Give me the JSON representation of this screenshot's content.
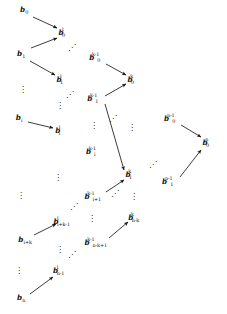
{
  "figure": {
    "type": "diagram",
    "subtype": "recursive-pairwise-reduction-tree",
    "glyphs": {
      "vertical_ellipsis": "⋮",
      "diagonal_ellipsis_up": "⋰"
    },
    "columns": [
      {
        "id": "level-0",
        "level_label": "0",
        "nodes": [
          {
            "id": "b0",
            "base": "b",
            "sub": "0",
            "sup": ""
          },
          {
            "id": "b1",
            "base": "b",
            "sub": "1",
            "sup": ""
          },
          {
            "id": "bi",
            "base": "b",
            "sub": "i",
            "sup": ""
          },
          {
            "id": "bik",
            "base": "b",
            "sub": "i+k",
            "sup": ""
          },
          {
            "id": "bn",
            "base": "b",
            "sub": "n",
            "sup": ""
          }
        ]
      },
      {
        "id": "level-1",
        "level_label": "1",
        "nodes": [
          {
            "id": "b0_1",
            "base": "b",
            "sub": "0",
            "sup": "1"
          },
          {
            "id": "b1_1",
            "base": "b",
            "sub": "1",
            "sup": "1"
          },
          {
            "id": "bi_1",
            "base": "b",
            "sub": "i",
            "sup": "1"
          },
          {
            "id": "bikm1_1",
            "base": "b",
            "sub": "i+k-1",
            "sup": "1"
          },
          {
            "id": "bnm1_1",
            "base": "b",
            "sub": "n-1",
            "sup": "1"
          }
        ]
      },
      {
        "id": "level-k-minus-1",
        "level_label": "k-1",
        "nodes": [
          {
            "id": "b0_km1",
            "base": "b",
            "sub": "0",
            "sup": "k-1"
          },
          {
            "id": "b1_km1",
            "base": "b",
            "sub": "1",
            "sup": "k-1"
          },
          {
            "id": "bi_km1",
            "base": "b",
            "sub": "i",
            "sup": "k-1"
          },
          {
            "id": "bip1_km1",
            "base": "b",
            "sub": "i+1",
            "sup": "k-1"
          },
          {
            "id": "bnmkp1_km1",
            "base": "b",
            "sub": "n-k+1",
            "sup": "k-1"
          }
        ]
      },
      {
        "id": "level-k",
        "level_label": "k",
        "nodes": [
          {
            "id": "b0_k",
            "base": "b",
            "sub": "0",
            "sup": "k"
          },
          {
            "id": "b1_k",
            "base": "b",
            "sub": "1",
            "sup": "k"
          },
          {
            "id": "bnmk_k",
            "base": "b",
            "sub": "n-k",
            "sup": "k"
          }
        ]
      },
      {
        "id": "level-n-minus-1",
        "level_label": "n-1",
        "nodes": [
          {
            "id": "b0_nm1",
            "base": "b",
            "sub": "0",
            "sup": "n-1"
          },
          {
            "id": "b1_nm1",
            "base": "b",
            "sub": "1",
            "sup": "n-1"
          }
        ]
      },
      {
        "id": "level-n",
        "level_label": "n",
        "nodes": [
          {
            "id": "b0_n",
            "base": "b",
            "sub": "0",
            "sup": "n"
          }
        ]
      }
    ],
    "edges": [
      {
        "from": "b0",
        "to": "b0_1"
      },
      {
        "from": "b1",
        "to": "b0_1"
      },
      {
        "from": "b1",
        "to": "b1_1"
      },
      {
        "from": "bi",
        "to": "bi_1"
      },
      {
        "from": "bik",
        "to": "bikm1_1"
      },
      {
        "from": "bn",
        "to": "bnm1_1"
      },
      {
        "from": "b0_km1",
        "to": "b0_k"
      },
      {
        "from": "b1_km1",
        "to": "b0_k"
      },
      {
        "from": "b1_km1",
        "to": "b1_k"
      },
      {
        "from": "bip1_km1",
        "to": "b1_k"
      },
      {
        "from": "bnmkp1_km1",
        "to": "bnmk_k"
      },
      {
        "from": "b0_nm1",
        "to": "b0_n"
      },
      {
        "from": "b1_nm1",
        "to": "b0_n"
      }
    ],
    "ellipses": [
      {
        "id": "e1",
        "kind": "diagonal_ellipsis_up",
        "glyph": "⋰"
      },
      {
        "id": "e2",
        "kind": "diagonal_ellipsis_up",
        "glyph": "⋰"
      },
      {
        "id": "e3",
        "kind": "diagonal_ellipsis_up",
        "glyph": "⋰"
      },
      {
        "id": "e4",
        "kind": "diagonal_ellipsis_up",
        "glyph": "⋰"
      },
      {
        "id": "e5",
        "kind": "diagonal_ellipsis_up",
        "glyph": "⋰"
      },
      {
        "id": "e6",
        "kind": "diagonal_ellipsis_up",
        "glyph": "⋰"
      },
      {
        "id": "e7",
        "kind": "diagonal_ellipsis_up",
        "glyph": "⋰"
      },
      {
        "id": "v1",
        "kind": "vertical_ellipsis",
        "glyph": "⋮"
      },
      {
        "id": "v2",
        "kind": "vertical_ellipsis",
        "glyph": "⋮"
      },
      {
        "id": "v3",
        "kind": "vertical_ellipsis",
        "glyph": "⋮"
      },
      {
        "id": "v4",
        "kind": "vertical_ellipsis",
        "glyph": "⋮"
      },
      {
        "id": "v5",
        "kind": "vertical_ellipsis",
        "glyph": "⋮"
      },
      {
        "id": "v6",
        "kind": "vertical_ellipsis",
        "glyph": "⋮"
      },
      {
        "id": "v7",
        "kind": "vertical_ellipsis",
        "glyph": "⋮"
      },
      {
        "id": "v8",
        "kind": "vertical_ellipsis",
        "glyph": "⋮"
      },
      {
        "id": "v9",
        "kind": "vertical_ellipsis",
        "glyph": "⋮"
      },
      {
        "id": "v10",
        "kind": "vertical_ellipsis",
        "glyph": "⋮"
      }
    ],
    "style": {
      "background": "#ffffff",
      "ink": "#141414",
      "arrow_color": "#1a1a1a"
    }
  },
  "layout": {
    "nodes": {
      "b0": {
        "x": 24,
        "y": 10
      },
      "b1": {
        "x": 21,
        "y": 54
      },
      "bi": {
        "x": 19,
        "y": 118
      },
      "bik": {
        "x": 25,
        "y": 240
      },
      "bn": {
        "x": 21,
        "y": 298
      },
      "b0_1": {
        "x": 64,
        "y": 33
      },
      "b1_1": {
        "x": 62,
        "y": 80
      },
      "bi_1": {
        "x": 60,
        "y": 131
      },
      "bikm1_1": {
        "x": 64,
        "y": 222
      },
      "bnm1_1": {
        "x": 61,
        "y": 271
      },
      "b0_km1": {
        "x": 97,
        "y": 58
      },
      "b1_km1": {
        "x": 95,
        "y": 99
      },
      "bi_km1": {
        "x": 93,
        "y": 152
      },
      "bip1_km1": {
        "x": 95,
        "y": 197
      },
      "bnmkp1_km1": {
        "x": 98,
        "y": 243
      },
      "b0_k": {
        "x": 133,
        "y": 80
      },
      "b1_k": {
        "x": 131,
        "y": 175
      },
      "bnmk_k": {
        "x": 136,
        "y": 218
      },
      "b0_nm1": {
        "x": 172,
        "y": 119
      },
      "b1_nm1": {
        "x": 170,
        "y": 182
      },
      "b0_n": {
        "x": 208,
        "y": 143
      }
    },
    "ellipses": {
      "e1": {
        "x": 72,
        "y": 48
      },
      "e2": {
        "x": 70,
        "y": 95
      },
      "e3": {
        "x": 74,
        "y": 207
      },
      "e4": {
        "x": 72,
        "y": 255
      },
      "e5": {
        "x": 113,
        "y": 119
      },
      "e6": {
        "x": 115,
        "y": 194
      },
      "e7": {
        "x": 153,
        "y": 165
      },
      "v1": {
        "x": 23,
        "y": 90
      },
      "v2": {
        "x": 21,
        "y": 196
      },
      "v3": {
        "x": 19,
        "y": 271
      },
      "v4": {
        "x": 60,
        "y": 106
      },
      "v5": {
        "x": 58,
        "y": 178
      },
      "v6": {
        "x": 60,
        "y": 250
      },
      "v7": {
        "x": 94,
        "y": 126
      },
      "v8": {
        "x": 92,
        "y": 219
      },
      "v9": {
        "x": 132,
        "y": 128
      },
      "v10": {
        "x": 134,
        "y": 197
      }
    },
    "edge_paths": {
      "b0:b0_1": {
        "x1": 33,
        "y1": 17,
        "x2": 57,
        "y2": 28
      },
      "b1:b0_1": {
        "x1": 31,
        "y1": 48,
        "x2": 57,
        "y2": 38
      },
      "b1:b1_1": {
        "x1": 30,
        "y1": 61,
        "x2": 55,
        "y2": 75
      },
      "bi:bi_1": {
        "x1": 28,
        "y1": 122,
        "x2": 53,
        "y2": 128
      },
      "bik:bikm1_1": {
        "x1": 34,
        "y1": 235,
        "x2": 56,
        "y2": 224
      },
      "bn:bnm1_1": {
        "x1": 30,
        "y1": 294,
        "x2": 53,
        "y2": 277
      },
      "b0_km1:b0_k": {
        "x1": 106,
        "y1": 64,
        "x2": 126,
        "y2": 75
      },
      "b1_km1:b0_k": {
        "x1": 105,
        "y1": 96,
        "x2": 126,
        "y2": 84
      },
      "b1_km1:b1_k": {
        "x1": 105,
        "y1": 104,
        "x2": 124,
        "y2": 170
      },
      "bip1_km1:b1_k": {
        "x1": 106,
        "y1": 192,
        "x2": 124,
        "y2": 180
      },
      "bnmkp1_km1:bnmk_k": {
        "x1": 109,
        "y1": 238,
        "x2": 128,
        "y2": 222
      },
      "b0_nm1:b0_n": {
        "x1": 181,
        "y1": 125,
        "x2": 201,
        "y2": 137
      },
      "b1_nm1:b0_n": {
        "x1": 180,
        "y1": 177,
        "x2": 201,
        "y2": 150
      }
    }
  }
}
